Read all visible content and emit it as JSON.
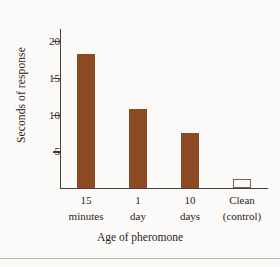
{
  "chart_data": {
    "type": "bar",
    "title": "",
    "xlabel": "Age of pheromone",
    "ylabel": "Seconds of response",
    "categories": [
      "15 minutes",
      "1 day",
      "10 days",
      "Clean (control)"
    ],
    "category_lines": [
      {
        "line1": "15",
        "line2": "minutes"
      },
      {
        "line1": "1",
        "line2": "day"
      },
      {
        "line1": "10",
        "line2": "days"
      },
      {
        "line1": "Clean",
        "line2": "(control)"
      }
    ],
    "values": [
      18.3,
      10.7,
      7.5,
      1.2
    ],
    "ylim": [
      0,
      21.5
    ],
    "yticks": [
      5,
      10,
      15,
      20
    ],
    "ytick_labels": [
      "5",
      "10",
      "15",
      "20"
    ],
    "grid": false,
    "legend": "none",
    "bar_style": [
      "filled",
      "filled",
      "filled",
      "outline"
    ],
    "colors": {
      "bar_fill": "#8c4a22",
      "bar_outline": "#6e655e",
      "axis": "#47413c",
      "text": "#2a2420",
      "background": "#fbfaf8",
      "rule": "#b9b4ae"
    }
  }
}
